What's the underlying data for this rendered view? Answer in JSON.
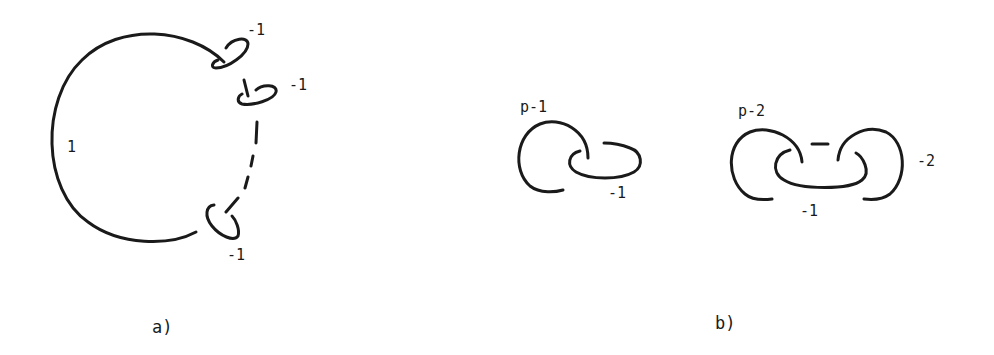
{
  "figure": {
    "panel_a": {
      "caption": "a)",
      "main_component_label": "1",
      "clasp_labels": [
        "-1",
        "-1",
        "-1"
      ]
    },
    "panel_b": {
      "caption": "b)",
      "left_diagram": {
        "arc_label": "p-1",
        "ellipse_label": "-1"
      },
      "right_diagram": {
        "left_arc_label": "p-2",
        "ellipse_label": "-1",
        "right_arc_label": "-2"
      }
    },
    "colors": {
      "ink": "#1a1a1a",
      "background": "#ffffff"
    }
  }
}
